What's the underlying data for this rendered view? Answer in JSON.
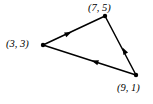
{
  "figure": {
    "title": "",
    "background_color": "#ffffff",
    "stroke_color": "#000000",
    "stroke_width": 1.5,
    "vertex_dot_radius": 2.2
  },
  "diagram_data": {
    "type": "directed-graph",
    "shape": "triangle",
    "vertices": [
      {
        "id": "A",
        "label": "(7, 5)",
        "coord": [
          7,
          5
        ],
        "px": [
          105,
          16
        ],
        "label_px": [
          88,
          3
        ],
        "label_position": "above"
      },
      {
        "id": "B",
        "label": "(3, 3)",
        "coord": [
          3,
          3
        ],
        "px": [
          43,
          45
        ],
        "label_px": [
          6,
          39
        ],
        "label_position": "left"
      },
      {
        "id": "C",
        "label": "(9, 1)",
        "coord": [
          9,
          1
        ],
        "px": [
          136,
          75
        ],
        "label_px": [
          117,
          83
        ],
        "label_position": "below"
      }
    ],
    "edges": [
      {
        "id": "edge-a-b",
        "from": "A",
        "to": "B",
        "from_px": [
          105,
          16
        ],
        "to_px": [
          43,
          45
        ],
        "arrow": "midpoint",
        "arrow_direction": "down-left"
      },
      {
        "id": "edge-a-c",
        "from": "A",
        "to": "C",
        "from_px": [
          105,
          16
        ],
        "to_px": [
          136,
          75
        ],
        "arrow": "midpoint",
        "arrow_direction": "down-right"
      },
      {
        "id": "edge-b-c",
        "from": "B",
        "to": "C",
        "from_px": [
          43,
          45
        ],
        "to_px": [
          136,
          75
        ],
        "arrow": "midpoint",
        "arrow_direction": "right"
      }
    ]
  },
  "labels": {
    "top": "(7, 5)",
    "left": "(3, 3)",
    "bottom_right": "(9, 1)"
  }
}
